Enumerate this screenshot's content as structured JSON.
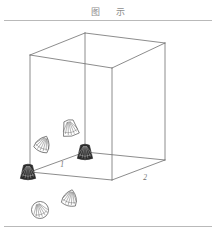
{
  "page": {
    "title": "图 示",
    "background_color": "#ffffff",
    "rule_color": "#b9b9b9",
    "line_color": "#6e6e6e",
    "shell_outline_color": "#5a5a5a",
    "shell_dark_fill": "#2b2b2b",
    "width": 216,
    "height": 233
  },
  "figure": {
    "type": "line-drawing",
    "box": {
      "name": "wireframe-box",
      "projection": "oblique-parallel",
      "top_face": {
        "left": {
          "x": 30,
          "y": 35
        },
        "back": {
          "x": 85,
          "y": 13
        },
        "right": {
          "x": 165,
          "y": 23
        },
        "front": {
          "x": 112,
          "y": 48
        }
      },
      "bottom_face": {
        "left": {
          "x": 30,
          "y": 152
        },
        "back": {
          "x": 85,
          "y": 132
        },
        "right": {
          "x": 165,
          "y": 140
        },
        "front": {
          "x": 112,
          "y": 160
        }
      },
      "vertical_edges": 4,
      "hidden_lines_shown": true
    },
    "edge_labels": [
      {
        "text": "1",
        "x": 62,
        "y": 147,
        "edge": "left-back-bottom-edge"
      },
      {
        "text": "2",
        "x": 145,
        "y": 160,
        "edge": "right-front-bottom-edge"
      }
    ],
    "shells": [
      {
        "id": "shell-1",
        "x": 70,
        "y": 108,
        "size": 17,
        "style": "outline",
        "kind": "ribbed-cone",
        "rotation": -12,
        "location": "inside-box-upper-left"
      },
      {
        "id": "shell-2",
        "x": 43,
        "y": 124,
        "size": 17,
        "style": "outline",
        "kind": "ribbed-fan",
        "rotation": 25,
        "location": "inside-box-left"
      },
      {
        "id": "shell-3",
        "x": 85,
        "y": 132,
        "size": 16,
        "style": "dark",
        "kind": "ribbed-cone",
        "rotation": 0,
        "location": "box-floor-back-corner"
      },
      {
        "id": "shell-4",
        "x": 28,
        "y": 152,
        "size": 16,
        "style": "dark",
        "kind": "ribbed-cone",
        "rotation": 0,
        "location": "box-floor-left-corner"
      },
      {
        "id": "shell-5",
        "x": 70,
        "y": 178,
        "size": 17,
        "style": "outline",
        "kind": "ribbed-fan",
        "rotation": 15,
        "location": "outside-box-below-front"
      },
      {
        "id": "shell-6",
        "x": 40,
        "y": 190,
        "size": 17,
        "style": "outline",
        "kind": "ribbed-round",
        "rotation": -20,
        "location": "outside-box-bottom-left"
      }
    ]
  }
}
